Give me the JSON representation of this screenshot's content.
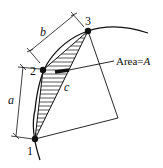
{
  "diagram": {
    "points": [
      {
        "id": "1",
        "label": "1"
      },
      {
        "id": "2",
        "label": "2"
      },
      {
        "id": "3",
        "label": "3"
      }
    ],
    "dimensions": {
      "a": "a",
      "b": "b",
      "c": "c"
    },
    "area_label": {
      "prefix": "Area=",
      "symbol": "A"
    },
    "colors": {
      "line": "#111111",
      "background": "#ffffff"
    }
  }
}
